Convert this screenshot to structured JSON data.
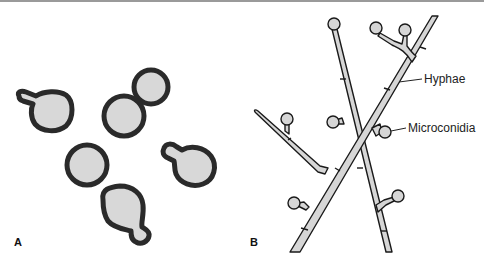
{
  "figure": {
    "panels": [
      {
        "id": "A",
        "label": "A",
        "subject": "yeast cells with buds"
      },
      {
        "id": "B",
        "label": "B",
        "subject": "hyphae with microconidia"
      }
    ],
    "annotations": [
      {
        "text": "Hyphae",
        "panel": "B"
      },
      {
        "text": "Microconidia",
        "panel": "B"
      }
    ],
    "colors": {
      "cell_fill": "#d8d8d8",
      "cell_wall": "#2a2a2a",
      "hypha_fill": "#d6d6d6",
      "hypha_outline": "#1a1a1a",
      "top_rule": "#9a9a9a"
    }
  }
}
